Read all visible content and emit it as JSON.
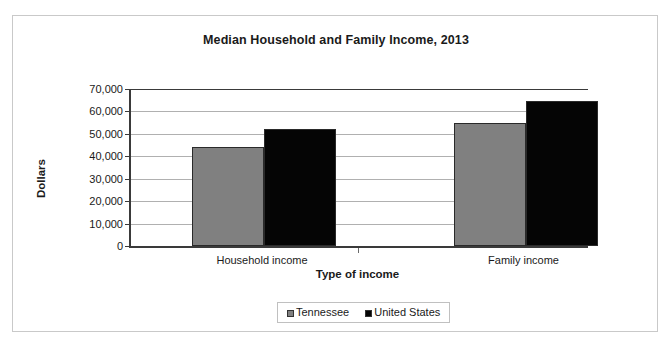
{
  "chart_data": {
    "type": "bar",
    "title": "Median Household and Family Income, 2013",
    "xlabel": "Type of income",
    "ylabel": "Dollars",
    "categories": [
      "Household income",
      "Family income"
    ],
    "series": [
      {
        "name": "Tennessee",
        "color": "#808080",
        "values": [
          44000,
          55000
        ]
      },
      {
        "name": "United States",
        "color": "#050505",
        "values": [
          52000,
          64500
        ]
      }
    ],
    "ylim": [
      0,
      70000
    ],
    "ytick_values": [
      0,
      10000,
      20000,
      30000,
      40000,
      50000,
      60000,
      70000
    ],
    "ytick_labels": [
      "0",
      "10,000",
      "20,000",
      "30,000",
      "40,000",
      "50,000",
      "60,000",
      "70,000"
    ],
    "grid": true,
    "legend_position": "bottom"
  },
  "legend": {
    "items": [
      {
        "label": "Tennessee",
        "swatch": "gray-square-icon"
      },
      {
        "label": "United States",
        "swatch": "black-square-icon"
      }
    ]
  }
}
